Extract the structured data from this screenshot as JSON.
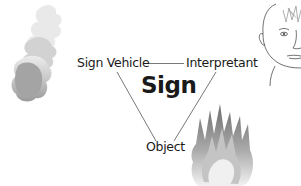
{
  "diagram": {
    "title": "Sign",
    "nodes": {
      "sign_vehicle": "Sign Vehicle",
      "interpretant": "Interpretant",
      "object": "Object"
    },
    "edges": [
      {
        "from": "Sign Vehicle",
        "to": "Interpretant"
      },
      {
        "from": "Sign Vehicle",
        "to": "Object"
      },
      {
        "from": "Interpretant",
        "to": "Object"
      }
    ],
    "illustrations": {
      "smoke": "smoke-illustration",
      "face": "face-illustration",
      "fire": "fire-illustration"
    },
    "colors": {
      "line": "#555555",
      "text": "#1a1a1a",
      "smoke_light": "#d9d9d9",
      "smoke_dark": "#9a9a9a",
      "fire_dark": "#777777",
      "fire_light": "#eeeeee"
    }
  }
}
